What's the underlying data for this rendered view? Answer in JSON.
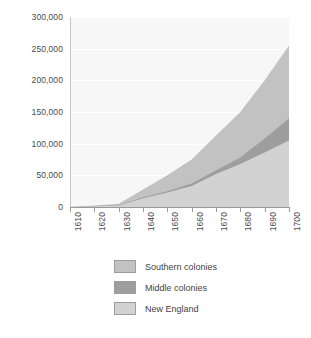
{
  "chart_data": {
    "type": "area",
    "stacked": true,
    "title": "",
    "subtitle": "",
    "xlabel": "",
    "ylabel": "",
    "categories": [
      "1610",
      "1620",
      "1630",
      "1640",
      "1650",
      "1660",
      "1670",
      "1680",
      "1690",
      "1700"
    ],
    "x": [
      1610,
      1620,
      1630,
      1640,
      1650,
      1660,
      1670,
      1680,
      1690,
      1700
    ],
    "xlim": [
      1610,
      1700
    ],
    "ylim": [
      0,
      300000
    ],
    "y_ticks": [
      0,
      50000,
      100000,
      150000,
      200000,
      250000,
      300000
    ],
    "y_tick_labels": [
      "0",
      "50,000",
      "100,000",
      "150,000",
      "200,000",
      "250,000",
      "300,000"
    ],
    "grid": true,
    "grid_color": "#ffffff",
    "plot_background": "#f7f7f7",
    "legend_position": "bottom",
    "stack_order_bottom_to_top": [
      "New England",
      "Middle colonies",
      "Southern colonies"
    ],
    "series": [
      {
        "name": "New England",
        "color": "#d2d2d2",
        "values": [
          0,
          1000,
          2000,
          14000,
          23000,
          33000,
          52000,
          68000,
          86000,
          105000
        ]
      },
      {
        "name": "Middle colonies",
        "color": "#9e9e9e",
        "values": [
          0,
          500,
          500,
          1500,
          2000,
          4000,
          6000,
          10000,
          22000,
          35000
        ]
      },
      {
        "name": "Southern colonies",
        "color": "#c2c2c2",
        "values": [
          0,
          1000,
          2500,
          12000,
          25000,
          38000,
          55000,
          72000,
          92000,
          115000
        ]
      }
    ],
    "cumulative_totals": [
      0,
      2500,
      5000,
      27500,
      50000,
      75000,
      113000,
      150000,
      200000,
      255000
    ]
  },
  "legend": {
    "items": [
      {
        "label": "Southern colonies",
        "color": "#c2c2c2"
      },
      {
        "label": "Middle colonies",
        "color": "#9e9e9e"
      },
      {
        "label": "New England",
        "color": "#d2d2d2"
      }
    ]
  }
}
